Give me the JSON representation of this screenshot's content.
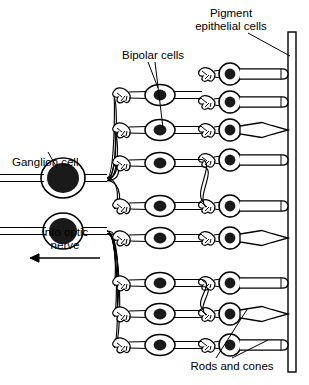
{
  "figure": {
    "background_color": "#ffffff",
    "line_color": "#000000",
    "nucleus_color": "#1a1a1a"
  },
  "labels": {
    "pigment_line1": "Pigment",
    "pigment_line2": "epithelial cells",
    "bipolar": "Bipolar cells",
    "ganglion": "Ganglion cell",
    "optic_line1": "Into optic",
    "optic_line2": "nerve",
    "rods_cones": "Rods and cones"
  },
  "structures": {
    "pigment_epithelium": {
      "name": "pigment-epithelial-layer",
      "x_outer": 296,
      "x_inner": 288,
      "y_top": 32,
      "y_bottom": 372
    },
    "ganglion_cells": [
      {
        "cx": 63,
        "cy": 178,
        "rx": 22,
        "ry": 20,
        "nucleus_rx": 16,
        "nucleus_ry": 15
      },
      {
        "cx": 63,
        "cy": 231,
        "rx": 20,
        "ry": 18,
        "nucleus_rx": 14,
        "nucleus_ry": 13
      }
    ],
    "bipolar_cells": [
      {
        "row": 1,
        "cx": 160,
        "cy": 95
      },
      {
        "row": 2,
        "cx": 160,
        "cy": 130
      },
      {
        "row": 3,
        "cx": 160,
        "cy": 163
      },
      {
        "row": 4,
        "cx": 160,
        "cy": 206
      },
      {
        "row": 5,
        "cx": 160,
        "cy": 238
      },
      {
        "row": 6,
        "cx": 160,
        "cy": 283
      },
      {
        "row": 7,
        "cx": 160,
        "cy": 314
      },
      {
        "row": 8,
        "cx": 160,
        "cy": 345
      }
    ],
    "photoreceptors": [
      {
        "row": 1,
        "type": "rod",
        "cx": 230,
        "cy": 74
      },
      {
        "row": 2,
        "type": "rod",
        "cx": 230,
        "cy": 102
      },
      {
        "row": 3,
        "type": "cone",
        "cx": 230,
        "cy": 130
      },
      {
        "row": 4,
        "type": "rod",
        "cx": 230,
        "cy": 160
      },
      {
        "row": 5,
        "type": "rod",
        "cx": 230,
        "cy": 206
      },
      {
        "row": 6,
        "type": "cone",
        "cx": 230,
        "cy": 238
      },
      {
        "row": 7,
        "type": "rod",
        "cx": 230,
        "cy": 283
      },
      {
        "row": 8,
        "type": "cone",
        "cx": 230,
        "cy": 314
      },
      {
        "row": 9,
        "type": "rod",
        "cx": 230,
        "cy": 345
      }
    ],
    "optic_arrow": {
      "x_start": 100,
      "x_end": 30,
      "y": 258
    }
  },
  "leaders": {
    "pigment": [
      {
        "x1": 248,
        "x2": 290,
        "y1": 33,
        "y2": 56
      }
    ],
    "bipolar": [
      {
        "x1": 148,
        "y1": 62,
        "x2": 158,
        "y2": 88
      },
      {
        "x1": 155,
        "y1": 62,
        "x2": 163,
        "y2": 128
      }
    ],
    "ganglion": [
      {
        "x1": 57,
        "y1": 168,
        "x2": 48,
        "y2": 152
      }
    ],
    "rods_cones": [
      {
        "x1": 216,
        "y1": 358,
        "x2": 248,
        "y2": 308
      },
      {
        "x1": 232,
        "y1": 358,
        "x2": 268,
        "y2": 340
      }
    ]
  }
}
